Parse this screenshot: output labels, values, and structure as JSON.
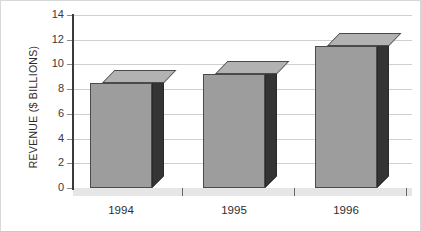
{
  "chart_data": {
    "type": "bar",
    "title": "",
    "subtitle": "",
    "xlabel": "",
    "ylabel": "REVENUE ($ BILLIONS)",
    "categories": [
      "1994",
      "1995",
      "1996"
    ],
    "values": [
      8.5,
      9.2,
      11.5
    ],
    "series": [
      {
        "name": "Revenue",
        "values": [
          8.5,
          9.2,
          11.5
        ]
      }
    ],
    "ylim": [
      0,
      14
    ],
    "ytick_values": [
      0,
      2,
      4,
      6,
      8,
      10,
      12,
      14
    ],
    "ytick_labels": [
      "0",
      "2",
      "4",
      "6",
      "8",
      "10",
      "12",
      "14"
    ],
    "grid": true,
    "grid_axis": "y",
    "legend": false,
    "legend_position": "none",
    "bar_style": "3d",
    "annotations": [],
    "colors": {
      "bar_front": "#9d9d9d",
      "bar_top": "#b2b2b2",
      "bar_side": "#343434",
      "bar_outline": "#4a4a4a",
      "gridline": "#cfcfcf",
      "axis": "#3a3a3a",
      "baseline": "#555555",
      "floor": "#e6e6e6",
      "text": "#2e2e2e",
      "background": "#ffffff",
      "frame": "#d8d8d8"
    }
  }
}
